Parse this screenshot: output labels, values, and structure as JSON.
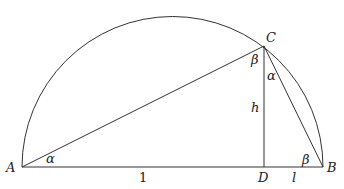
{
  "diagram": {
    "type": "semicircle right-triangle construction",
    "points": {
      "A": {
        "label": "A",
        "x": 22,
        "y": 167
      },
      "B": {
        "label": "B",
        "x": 323,
        "y": 167
      },
      "C": {
        "label": "C",
        "x": 264,
        "y": 46
      },
      "D": {
        "label": "D",
        "x": 264,
        "y": 167
      }
    },
    "segment_labels": {
      "AD": "1",
      "DB": "l",
      "CD": "h"
    },
    "angle_labels": {
      "at_A": "α",
      "at_C_left": "β",
      "at_C_right": "α",
      "at_B": "β"
    }
  }
}
